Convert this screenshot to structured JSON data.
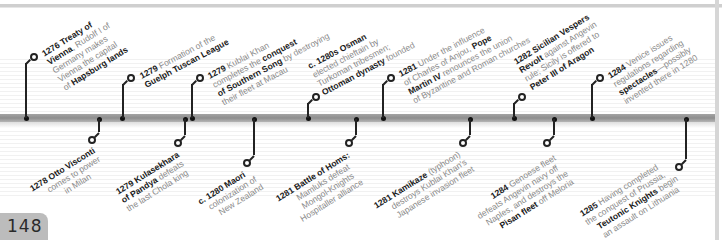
{
  "page": {
    "number": "148"
  },
  "colors": {
    "axis": "#9a9a9a",
    "marker": "#111111",
    "bold_text": "#1a1a1a",
    "body_text": "#8a8a8a",
    "page_tab": "#bcbcbc"
  },
  "timeline": {
    "above": [
      {
        "id": "e1276",
        "year": "1276",
        "lines": [
          [
            "1276 Treaty of",
            true
          ],
          [
            "Vienna",
            true,
            ", Rudolf I of"
          ],
          [
            "Germany makes",
            false
          ],
          [
            "Vienna the capital",
            false
          ],
          [
            "of ",
            false,
            "Hapsburg lands"
          ]
        ]
      },
      {
        "id": "e1279a",
        "year": "1279"
      },
      {
        "id": "e1279b",
        "year": "1279"
      },
      {
        "id": "e1280s",
        "year": "c. 1280s"
      },
      {
        "id": "e1281a",
        "year": "1281"
      },
      {
        "id": "e1282",
        "year": "1282"
      },
      {
        "id": "e1284a",
        "year": "1284"
      }
    ]
  },
  "events": {
    "e1276": {
      "l1_b": "1276 Treaty of",
      "l2_b": "Vienna",
      "l2": ", Rudolf I of",
      "l3": "Germany makes",
      "l4": "Vienna the capital",
      "l5": "of ",
      "l5_b": "Hapsburg lands"
    },
    "e1279a": {
      "l1_b": "1279",
      "l1": " Formation of the",
      "l2_b": "Guelph Tuscan League"
    },
    "e1279b": {
      "l1_b": "1279",
      "l1": " Kublai Khan",
      "l2": "completes the ",
      "l2_b": "conquest",
      "l3_b": "of Southern Song",
      "l3": " by destroying",
      "l4": "their fleet at Macau"
    },
    "e1280s": {
      "l1_b": "c. 1280s Osman",
      "l2": "elected chieftain by",
      "l3": "Turkoman tribesmen;",
      "l4_b": "Ottoman dynasty",
      "l4": " founded"
    },
    "e1281a": {
      "l1_b": "1281",
      "l1": " Under the influence",
      "l2": "of Charles of Anjou, ",
      "l2_b": "Pope",
      "l3_b": "Martin IV",
      "l3": " renounces the union",
      "l4": "of Byzantine and Roman churches"
    },
    "e1282": {
      "l1_b": "1282 Sicilian Vespers",
      "l2_b": "Revolt",
      "l2": " against Angevin",
      "l3": "rule; Sicily is offered to",
      "l4_b": "Peter III of Aragon"
    },
    "e1284a": {
      "l1_b": "1284",
      "l1": " Venice issues",
      "l2": "regulations regarding",
      "l3_b": "spectacles",
      "l3": "—possibly",
      "l4": "invented there in 1280"
    },
    "e1278": {
      "l1_b": "1278 Otto Visconti",
      "l2": "comes to power",
      "l3": "in Milan"
    },
    "e1279c": {
      "l1_b": "1279 Kulasekhara",
      "l2_b": "of Pandya",
      "l2": " defeats",
      "l3": "the last Chola king"
    },
    "e1280": {
      "l1_b": "c. 1280 Maori",
      "l2": "colonization of",
      "l3": "New Zealand"
    },
    "e1281b": {
      "l1_b": "1281 Battle of Homs:",
      "l2": "Mamluks defeat",
      "l3": "Mongol-Knights",
      "l4": "Hospitaller alliance"
    },
    "e1281c": {
      "l1_b": "1281 Kamikaze",
      "l1": " (typhoon)",
      "l2": "destroys Kublai Khan's",
      "l3": "Japanese invasion fleet"
    },
    "e1284b": {
      "l1_b": "1284",
      "l1": " Genoese fleet",
      "l2": "defeats Angevin navy off",
      "l3": "Naples, and destroys the",
      "l4_b": "Pisan fleet",
      "l4": " off Meloria"
    },
    "e1285": {
      "l1_b": "1285",
      "l1": " Having completed",
      "l2": "the conquest of Prussia,",
      "l3_b": "Teutonic Knights",
      "l3": " begin",
      "l4": "an assault on Lithuania"
    }
  }
}
